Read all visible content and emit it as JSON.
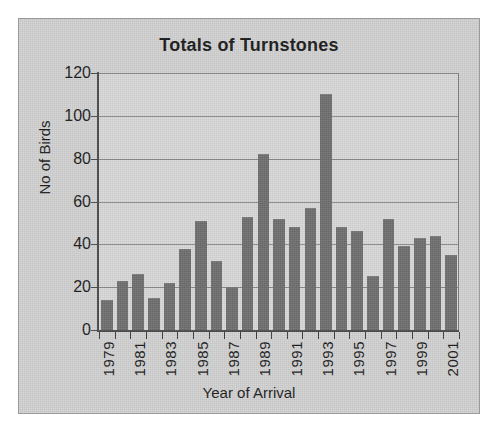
{
  "figure": {
    "title": "Totals of Turnstones",
    "background_color": "#d2d2d2",
    "plot_background_color": "#d9d9d9",
    "bar_color": "#6e6e6e",
    "axis_color": "#4a4a4a",
    "gridline_color": "#8a8a8a"
  },
  "chart_data": {
    "type": "bar",
    "title": "Totals of Turnstones",
    "xlabel": "Year of Arrival",
    "ylabel": "No of Birds",
    "ylim": [
      0,
      120
    ],
    "ytick_labels": [
      "0",
      "20",
      "40",
      "60",
      "80",
      "100",
      "120"
    ],
    "yticks": [
      0,
      20,
      40,
      60,
      80,
      100,
      120
    ],
    "grid": true,
    "legend": false,
    "categories": [
      "1979",
      "1980",
      "1981",
      "1982",
      "1983",
      "1984",
      "1985",
      "1986",
      "1987",
      "1988",
      "1989",
      "1990",
      "1991",
      "1992",
      "1993",
      "1994",
      "1995",
      "1996",
      "1997",
      "1998",
      "1999",
      "2000",
      "2001"
    ],
    "xtick_labels": [
      "1979",
      "",
      "1981",
      "",
      "1983",
      "",
      "1985",
      "",
      "1987",
      "",
      "1989",
      "",
      "1991",
      "",
      "1993",
      "",
      "1995",
      "",
      "1997",
      "",
      "1999",
      "",
      "2001"
    ],
    "values": [
      14,
      23,
      26,
      15,
      22,
      38,
      51,
      32,
      20,
      53,
      82,
      52,
      48,
      57,
      110,
      48,
      46,
      25,
      52,
      39,
      43,
      44,
      35
    ]
  }
}
